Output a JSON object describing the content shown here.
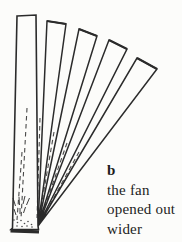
{
  "figure": {
    "label": "b",
    "caption_lines": [
      "the fan",
      "opened out",
      "wider"
    ],
    "ink_color": "#2b2b2b",
    "paper_color": "#fcfcfa",
    "pivot": [
      38,
      226
    ],
    "front_blade": {
      "outline": [
        [
          17,
          16
        ],
        [
          36,
          15
        ],
        [
          38,
          226
        ],
        [
          38.5,
          229.5
        ],
        [
          11,
          229.5
        ],
        [
          12.5,
          228
        ]
      ],
      "base_cap": [
        10.5,
        230.8,
        39,
        231.8
      ]
    },
    "blades_back_to_front": [
      {
        "tip_left": [
          137,
          58
        ],
        "tip_right": [
          157,
          69
        ]
      },
      {
        "tip_left": [
          109,
          40
        ],
        "tip_right": [
          127,
          49
        ]
      },
      {
        "tip_left": [
          79,
          29
        ],
        "tip_right": [
          97,
          36
        ]
      },
      {
        "tip_left": [
          47,
          21
        ],
        "tip_right": [
          66,
          24
        ]
      }
    ],
    "dashed_lines": [
      [
        27,
        108,
        21,
        219
      ],
      [
        22,
        152,
        17,
        220
      ],
      [
        40,
        118,
        37,
        218
      ],
      [
        54,
        132,
        39,
        219
      ],
      [
        67,
        143,
        40,
        220
      ],
      [
        79,
        152,
        41,
        221
      ]
    ],
    "hatch_marks": [
      [
        13,
        198,
        15.5,
        206
      ],
      [
        19,
        197,
        19.5,
        205
      ],
      [
        25,
        196,
        23,
        204
      ],
      [
        29.5,
        198,
        26.5,
        205
      ],
      [
        14,
        209,
        16,
        215
      ],
      [
        20,
        208,
        20,
        214
      ],
      [
        25.5,
        207,
        23.5,
        213
      ]
    ],
    "stipple_dots": [
      [
        14,
        220
      ],
      [
        17.5,
        222.5
      ],
      [
        21,
        220.5
      ],
      [
        24.5,
        223.5
      ],
      [
        28,
        221.5
      ],
      [
        31.5,
        224.5
      ],
      [
        17,
        226
      ],
      [
        22,
        226.5
      ],
      [
        27,
        226
      ],
      [
        32,
        227
      ]
    ]
  }
}
